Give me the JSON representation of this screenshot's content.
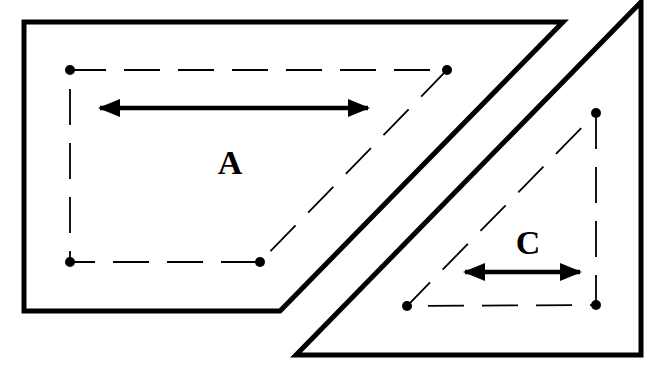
{
  "diagram": {
    "colors": {
      "stroke": "#000000",
      "background": "#ffffff"
    },
    "shapes": [
      {
        "id": "parallelogram-piece",
        "label": "A",
        "outline": [
          [
            24,
            22
          ],
          [
            563,
            22
          ],
          [
            280,
            311
          ],
          [
            24,
            311
          ]
        ],
        "inner_dashed": [
          [
            70,
            70
          ],
          [
            447,
            70
          ],
          [
            260,
            262
          ],
          [
            70,
            262
          ]
        ],
        "dots": [
          [
            70,
            70
          ],
          [
            447,
            70
          ],
          [
            260,
            262
          ],
          [
            70,
            262
          ]
        ],
        "arrow": {
          "from": [
            98,
            108
          ],
          "to": [
            370,
            108
          ],
          "double": true
        },
        "label_pos": [
          230,
          174
        ]
      },
      {
        "id": "triangle-piece",
        "label": "C",
        "outline": [
          [
            641,
            2
          ],
          [
            641,
            355
          ],
          [
            296,
            355
          ]
        ],
        "inner_dashed": [
          [
            596,
            113
          ],
          [
            596,
            305
          ],
          [
            407,
            306
          ]
        ],
        "dots": [
          [
            596,
            113
          ],
          [
            596,
            305
          ],
          [
            407,
            306
          ]
        ],
        "arrow": {
          "from": [
            463,
            272
          ],
          "to": [
            582,
            272
          ],
          "double": true
        },
        "label_pos": [
          528,
          254
        ]
      }
    ]
  }
}
